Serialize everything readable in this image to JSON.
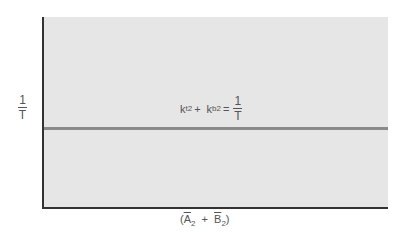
{
  "diagram": {
    "y_axis_label": {
      "numerator": "1",
      "denominator": "T"
    },
    "x_axis_label": {
      "open": "(",
      "a": "A",
      "a_sub": "2",
      "plus": "+",
      "b": "B",
      "b_sub": "2",
      "close": ")"
    },
    "equation": {
      "term1": "k",
      "term1_sub": "t2",
      "plus": "+",
      "term2": "k",
      "term2_sub": "b2",
      "equals": "=",
      "rhs_numerator": "1",
      "rhs_denominator": "T"
    },
    "colors": {
      "plot_bg": "#e6e6e6",
      "axis": "#333333",
      "line": "#8a8a8a"
    }
  }
}
